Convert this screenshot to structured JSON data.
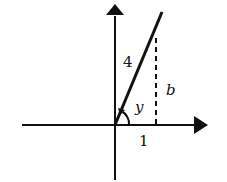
{
  "diagram": {
    "type": "right-triangle-on-axes",
    "colors": {
      "stroke": "#111111",
      "background": "#ffffff"
    },
    "labels": {
      "hypotenuse": "4",
      "opposite": "b",
      "adjacent": "1",
      "angle": "y"
    }
  }
}
